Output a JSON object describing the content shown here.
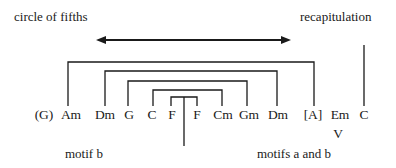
{
  "labels": {
    "top_left": "circle of fifths",
    "top_right": "recapitulation",
    "bottom_left": "motif b",
    "bottom_right": "motifs a and b"
  },
  "chords": [
    "(G)",
    "Am",
    "Dm",
    "G",
    "C",
    "F",
    "F",
    "Cm",
    "Gm",
    "Dm",
    "[A]",
    "Em",
    "C"
  ],
  "roman_numeral": "V",
  "colors": {
    "line": "#1a1a1a",
    "text": "#1a1a1a",
    "background": "#ffffff"
  }
}
